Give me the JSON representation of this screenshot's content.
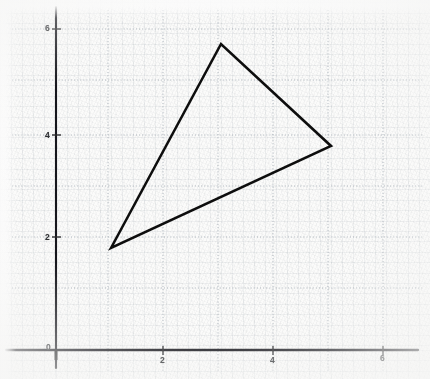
{
  "figure": {
    "background_color": "#fbfbfa",
    "ink_color": "#1a1a1a",
    "grid_color": "#b9c0c8"
  },
  "axes": {
    "x_axis_label_0": "0",
    "y_axis_name": "y-axis",
    "x_axis_name": "x-axis",
    "x_ticks": [
      {
        "value": 2,
        "label": "2",
        "px": 163
      },
      {
        "value": 4,
        "label": "4",
        "px": 273
      },
      {
        "value": 6,
        "label": "6",
        "px": 383
      }
    ],
    "y_ticks": [
      {
        "value": 2,
        "label": "2",
        "px": 237
      },
      {
        "value": 4,
        "label": "4",
        "px": 135
      },
      {
        "value": 6,
        "label": "6",
        "px": 29
      }
    ],
    "origin_label": "0"
  },
  "chart_data": {
    "type": "line",
    "title": "",
    "xlabel": "",
    "ylabel": "",
    "xlim": [
      -0.9,
      6.8
    ],
    "ylim": [
      -0.55,
      6.9
    ],
    "grid": true,
    "grid_major_step": 2,
    "grid_minor_step": 1,
    "legend": "none",
    "series": [
      {
        "name": "triangle",
        "shape": "closed-polygon",
        "stroke": "#111111",
        "stroke_width": 2.6,
        "fill": "none",
        "points": [
          {
            "x": 1,
            "y": 2,
            "name": "vertex-bottom-left"
          },
          {
            "x": 3,
            "y": 6,
            "name": "vertex-top"
          },
          {
            "x": 5,
            "y": 4,
            "name": "vertex-right"
          }
        ]
      }
    ],
    "x": [
      1,
      3,
      5,
      1
    ],
    "y": [
      2,
      6,
      4,
      2
    ],
    "xticks": [
      0,
      2,
      4,
      6
    ],
    "yticks": [
      0,
      2,
      4,
      6
    ]
  }
}
